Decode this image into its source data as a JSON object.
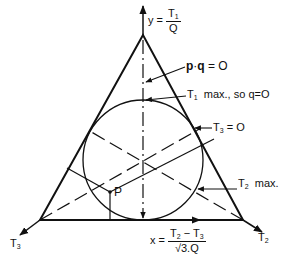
{
  "diagram": {
    "y_axis": {
      "prefix": "y =",
      "num": "T",
      "num_sub": "1",
      "den": "Q"
    },
    "x_axis": {
      "prefix": "x =",
      "num_a": "T",
      "num_a_sub": "2",
      "minus": "−",
      "num_b": "T",
      "num_b_sub": "3",
      "den": "√3.Q"
    },
    "pq_label": {
      "p": "p",
      "dot": "·",
      "q": "q",
      "rest": "= O"
    },
    "t1max_label": {
      "t": "T",
      "sub": "1",
      "rest": "max., so q=O"
    },
    "t3zero_label": {
      "t": "T",
      "sub": "3",
      "rest": "= O"
    },
    "t2max_label": {
      "t": "T",
      "sub": "2",
      "rest": "max."
    },
    "point_label": "P",
    "vertex_left": {
      "t": "T",
      "sub": "3"
    },
    "vertex_right": {
      "t": "T",
      "sub": "2"
    }
  }
}
